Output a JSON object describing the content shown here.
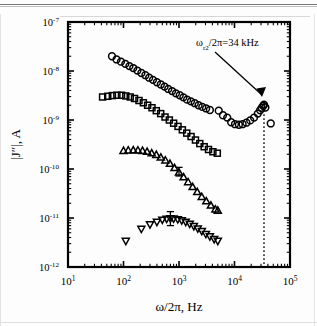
{
  "figure": {
    "title": "",
    "annotation_text": "ω",
    "annotation_sub": "r2",
    "annotation_rest": "/2π=34 kHz"
  },
  "chart_data": {
    "type": "scatter",
    "title": "",
    "xlabel": "ω/2π, Hz",
    "ylabel": "|J″|, A",
    "xscale": "log",
    "yscale": "log",
    "xlim": [
      10,
      100000
    ],
    "ylim": [
      1e-12,
      1e-07
    ],
    "grid": false,
    "legend": "none",
    "xticklabels": [
      "10¹",
      "10²",
      "10³",
      "10⁴",
      "10⁵"
    ],
    "xtick_base": [
      "10",
      "10",
      "10",
      "10",
      "10"
    ],
    "xtick_exp": [
      "1",
      "2",
      "3",
      "4",
      "5"
    ],
    "ytick_base": [
      "10",
      "10",
      "10",
      "10",
      "10",
      "10"
    ],
    "ytick_exp": [
      "-7",
      "-8",
      "-9",
      "-10",
      "-11",
      "-12"
    ],
    "yticklabels": [
      "10⁻⁷",
      "10⁻⁸",
      "10⁻⁹",
      "10⁻¹⁰",
      "10⁻¹¹",
      "10⁻¹²"
    ],
    "annotations": [
      {
        "text": "ωr2/2π=34 kHz",
        "x": 34000,
        "y": 2e-09,
        "kind": "arrow-label"
      }
    ],
    "vlines": [
      {
        "x": 34000,
        "style": "dotted",
        "label": "ωr2/2π=34 kHz"
      }
    ],
    "series": [
      {
        "name": "series-1-circles",
        "marker": "circle",
        "x": [
          62,
          75,
          90,
          108,
          128,
          150,
          178,
          210,
          248,
          290,
          340,
          400,
          470,
          550,
          640,
          750,
          880,
          1030,
          1200,
          1400,
          1640,
          1920,
          2250,
          2630,
          3080,
          3600,
          5200,
          6200,
          7400,
          8700,
          10200,
          12000,
          14000,
          16400,
          19200,
          22500,
          26300,
          29000,
          31000,
          33000,
          34000,
          36000,
          45000
        ],
        "y": [
          2e-08,
          1.72e-08,
          1.55e-08,
          1.4e-08,
          1.26e-08,
          1.15e-08,
          1.02e-08,
          9.1e-09,
          8.2e-09,
          7.3e-09,
          6.6e-09,
          5.9e-09,
          5.3e-09,
          4.8e-09,
          4.3e-09,
          3.9e-09,
          3.5e-09,
          3.2e-09,
          2.9e-09,
          2.6e-09,
          2.4e-09,
          2.2e-09,
          2e-09,
          1.85e-09,
          1.72e-09,
          1.6e-09,
          1.55e-09,
          1.25e-09,
          1.12e-09,
          9e-10,
          8.2e-10,
          8e-10,
          8.2e-10,
          8.8e-10,
          9.8e-10,
          1.12e-09,
          1.35e-09,
          1.58e-09,
          1.78e-09,
          1.95e-09,
          2.05e-09,
          1.8e-09,
          8.5e-10
        ]
      },
      {
        "name": "series-2-squares",
        "marker": "square",
        "x": [
          42,
          52,
          63,
          76,
          92,
          110,
          132,
          158,
          190,
          228,
          272,
          326,
          390,
          468,
          560,
          670,
          800,
          960,
          1150,
          1380,
          1650,
          1980,
          2370,
          2840,
          3400,
          4080,
          4900
        ],
        "y": [
          2.95e-09,
          3.05e-09,
          3.15e-09,
          3.2e-09,
          3.2e-09,
          3.1e-09,
          2.95e-09,
          2.75e-09,
          2.5e-09,
          2.25e-09,
          2e-09,
          1.78e-09,
          1.55e-09,
          1.35e-09,
          1.15e-09,
          1e-09,
          8.6e-10,
          7.4e-10,
          6.3e-10,
          5.4e-10,
          4.6e-10,
          3.9e-10,
          3.3e-10,
          2.85e-10,
          2.5e-10,
          2.25e-10,
          2.1e-10
        ]
      },
      {
        "name": "series-3-triangles",
        "marker": "triangle-up",
        "x": [
          100,
          122,
          150,
          182,
          220,
          266,
          322,
          390,
          470,
          568,
          686,
          830,
          1000,
          1210,
          1460,
          1760,
          2130,
          2570,
          3100,
          3750,
          4530,
          5000
        ],
        "y": [
          2.35e-10,
          2.4e-10,
          2.42e-10,
          2.4e-10,
          2.35e-10,
          2.25e-10,
          2.1e-10,
          1.95e-10,
          1.72e-10,
          1.5e-10,
          1.28e-10,
          1.05e-10,
          8.5e-11,
          6.8e-11,
          5.4e-11,
          4.3e-11,
          3.4e-11,
          2.7e-11,
          2.2e-11,
          1.8e-11,
          1.5e-11,
          1.42e-11
        ]
      },
      {
        "name": "series-4-down-triangles",
        "marker": "triangle-down",
        "x": [
          110,
          210,
          300,
          400,
          500,
          600,
          700,
          800,
          950,
          1120,
          1320,
          1560,
          1850,
          2180,
          2580,
          3050,
          3600,
          4300,
          5000
        ],
        "y": [
          3.4e-12,
          6e-12,
          7.4e-12,
          8.3e-12,
          9.2e-12,
          9.6e-12,
          9.8e-12,
          9.7e-12,
          9.4e-12,
          8.9e-12,
          8.3e-12,
          7.6e-12,
          6.8e-12,
          6.1e-12,
          5.4e-12,
          4.7e-12,
          4.2e-12,
          3.7e-12,
          3.4e-12
        ]
      }
    ],
    "errorbars": [
      {
        "series": "series-4-down-triangles",
        "x": 700,
        "y": 9.8e-12,
        "ylow": 7e-12,
        "yhigh": 1.35e-11
      },
      {
        "series": "series-3-triangles",
        "x": 1000,
        "y": 8.5e-11,
        "ylow": 7.2e-11,
        "yhigh": 1.08e-10
      }
    ]
  }
}
